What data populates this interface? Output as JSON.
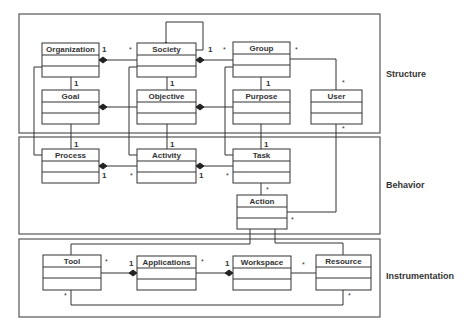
{
  "diagram": {
    "type": "UML class diagram",
    "layers": [
      {
        "id": "structure",
        "label": "Structure"
      },
      {
        "id": "behavior",
        "label": "Behavior"
      },
      {
        "id": "instrumentation",
        "label": "Instrumentation"
      }
    ],
    "classes": {
      "organization": "Organization",
      "society": "Society",
      "group": "Group",
      "goal": "Goal",
      "objective": "Objective",
      "purpose": "Purpose",
      "user": "User",
      "process": "Process",
      "activity": "Activity",
      "task": "Task",
      "action": "Action",
      "tool": "Tool",
      "applications": "Applications",
      "workspace": "Workspace",
      "resource": "Resource"
    },
    "multiplicity": {
      "one": "1",
      "many": "*"
    },
    "relations": [
      {
        "from": "Society",
        "to": "Society",
        "kind": "composition"
      },
      {
        "from": "Organization",
        "to": "Society",
        "kind": "composition",
        "mult_from": "1",
        "mult_to": "*"
      },
      {
        "from": "Society",
        "to": "Group",
        "kind": "composition",
        "mult_from": "1",
        "mult_to": "*"
      },
      {
        "from": "Organization",
        "to": "Goal",
        "kind": "association",
        "mult_to": "1"
      },
      {
        "from": "Society",
        "to": "Objective",
        "kind": "association",
        "mult_to": "1"
      },
      {
        "from": "Group",
        "to": "Purpose",
        "kind": "association",
        "mult_to": "1"
      },
      {
        "from": "Group",
        "to": "User",
        "kind": "association",
        "mult_from": "*",
        "mult_to": "*"
      },
      {
        "from": "Goal",
        "to": "Objective",
        "kind": "composition"
      },
      {
        "from": "Objective",
        "to": "Purpose",
        "kind": "composition"
      },
      {
        "from": "Goal",
        "to": "Process",
        "kind": "association",
        "mult_to": "1"
      },
      {
        "from": "Objective",
        "to": "Activity",
        "kind": "association",
        "mult_to": "1"
      },
      {
        "from": "Purpose",
        "to": "Task",
        "kind": "association",
        "mult_to": "1"
      },
      {
        "from": "Process",
        "to": "Activity",
        "kind": "composition",
        "mult_from": "1",
        "mult_to": "*"
      },
      {
        "from": "Activity",
        "to": "Task",
        "kind": "composition",
        "mult_from": "1",
        "mult_to": "*"
      },
      {
        "from": "Task",
        "to": "Action",
        "kind": "association",
        "mult_to": "*"
      },
      {
        "from": "User",
        "to": "Action",
        "kind": "association",
        "mult_from": "*",
        "mult_to": "*"
      },
      {
        "from": "Tool",
        "to": "Applications",
        "kind": "composition",
        "mult_from": "*",
        "mult_to": "1"
      },
      {
        "from": "Applications",
        "to": "Workspace",
        "kind": "composition",
        "mult_from": "*",
        "mult_to": "1"
      },
      {
        "from": "Workspace",
        "to": "Resource",
        "kind": "association",
        "mult_to": "*"
      },
      {
        "from": "Tool",
        "to": "Resource",
        "kind": "association",
        "mult_from": "*",
        "mult_to": "*"
      },
      {
        "from": "Action",
        "to": "Tool",
        "kind": "association"
      },
      {
        "from": "Action",
        "to": "Resource",
        "kind": "association"
      }
    ]
  }
}
